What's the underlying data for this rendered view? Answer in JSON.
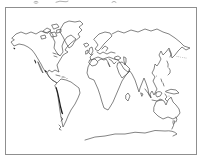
{
  "page": {
    "background_color": "#ffffff"
  },
  "map": {
    "kind": "world-map-outline-sketch",
    "frame_color": "#8f8f8f",
    "line_color": "#4f4f4f",
    "dark_mark_color": "#1c1c1c",
    "dot_color": "#8a8a8a",
    "fragment_color": "#9a9a9a",
    "regions": [
      "North America",
      "Greenland",
      "Arctic Islands",
      "Central America",
      "South America",
      "Andes",
      "Tierra del Fuego",
      "Iceland",
      "British Isles",
      "Scandinavia",
      "Europe",
      "Black Sea",
      "Caspian Sea",
      "Africa",
      "Madagascar",
      "Arabia",
      "Asia",
      "India",
      "Sri Lanka",
      "Japan",
      "Sakhalin",
      "Kuril Islands",
      "Philippines",
      "Borneo",
      "Sumatra",
      "Java",
      "Sulawesi",
      "New Guinea",
      "Australia",
      "Tasmania",
      "New Zealand",
      "Antarctica"
    ]
  }
}
